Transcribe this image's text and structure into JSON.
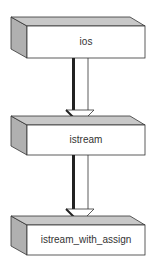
{
  "diagram": {
    "nodes": [
      {
        "id": "ios",
        "label": "ios"
      },
      {
        "id": "istream",
        "label": "istream"
      },
      {
        "id": "istream_with_assign",
        "label": "istream_with_assign"
      }
    ],
    "edges": [
      {
        "from": "ios",
        "to": "istream"
      },
      {
        "from": "istream",
        "to": "istream_with_assign"
      }
    ],
    "colors": {
      "side": "#b0b0b0",
      "top": "#c8c8c8",
      "front": "#ffffff",
      "stroke": "#333333"
    }
  }
}
